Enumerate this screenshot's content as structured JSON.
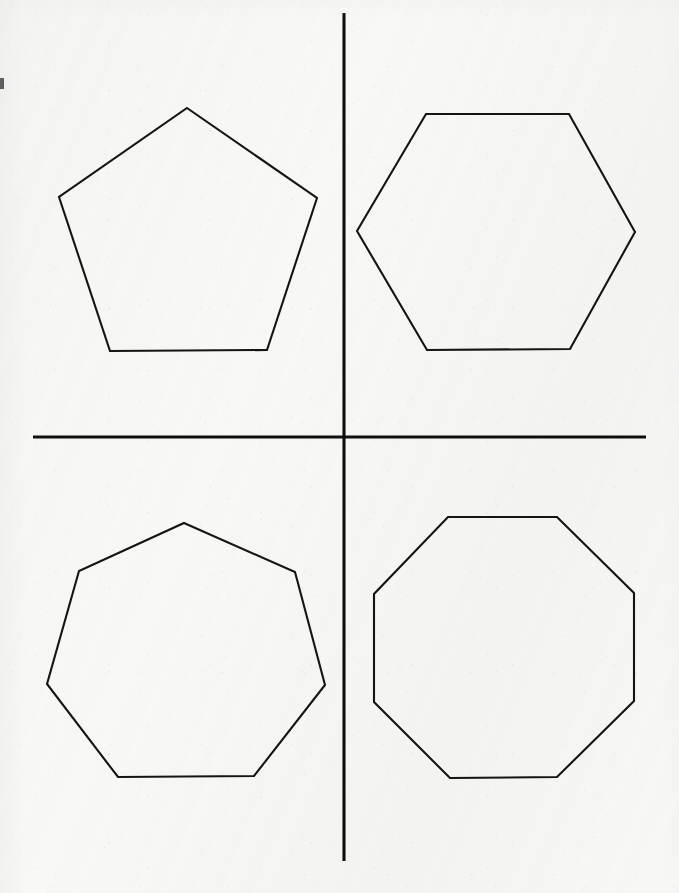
{
  "page": {
    "width": 679,
    "height": 893,
    "background_color": "#f8f8f7",
    "ink_color": "#141414",
    "axis_ink_color": "#0e0e0e",
    "medium": "scanned-paper"
  },
  "axes": {
    "name": "cross-divider",
    "vertical": {
      "x": 344,
      "y1": 13,
      "y2": 861,
      "stroke_width": 3
    },
    "horizontal": {
      "y": 437,
      "x1": 33,
      "x2": 646,
      "stroke_width": 3
    },
    "center": {
      "x": 344,
      "y": 437
    }
  },
  "artifacts": [
    {
      "name": "edge-smudge-left",
      "x": 0,
      "y": 78,
      "width": 4,
      "height": 11
    }
  ],
  "chart_data": {
    "type": "diagram",
    "grid": false,
    "legend": false,
    "shapes": [
      {
        "name": "pentagon",
        "sides": 5,
        "quadrant": "top-left",
        "center": {
          "x": 188,
          "y": 241
        },
        "circumradius": 133,
        "rotation_deg": -90,
        "vertices": [
          [
            187,
            108
          ],
          [
            317,
            198
          ],
          [
            267,
            350
          ],
          [
            110,
            351
          ],
          [
            59,
            197
          ]
        ]
      },
      {
        "name": "hexagon",
        "sides": 6,
        "quadrant": "top-right",
        "center": {
          "x": 496,
          "y": 232
        },
        "circumradius": 139,
        "rotation_deg": 0,
        "vertices": [
          [
            426,
            114
          ],
          [
            569,
            114
          ],
          [
            635,
            232
          ],
          [
            570,
            349
          ],
          [
            427,
            350
          ],
          [
            357,
            231
          ]
        ]
      },
      {
        "name": "heptagon",
        "sides": 7,
        "quadrant": "bottom-left",
        "center": {
          "x": 186,
          "y": 659
        },
        "circumradius": 136,
        "rotation_deg": -90,
        "vertices": [
          [
            184,
            523
          ],
          [
            295,
            572
          ],
          [
            325,
            685
          ],
          [
            254,
            776
          ],
          [
            118,
            777
          ],
          [
            47,
            684
          ],
          [
            79,
            571
          ]
        ]
      },
      {
        "name": "octagon",
        "sides": 8,
        "quadrant": "bottom-right",
        "center": {
          "x": 504,
          "y": 647
        },
        "circumradius": 142,
        "rotation_deg": 22.5,
        "vertices": [
          [
            448,
            517
          ],
          [
            557,
            517
          ],
          [
            634,
            593
          ],
          [
            634,
            701
          ],
          [
            557,
            777
          ],
          [
            450,
            778
          ],
          [
            374,
            702
          ],
          [
            374,
            594
          ]
        ]
      }
    ]
  }
}
